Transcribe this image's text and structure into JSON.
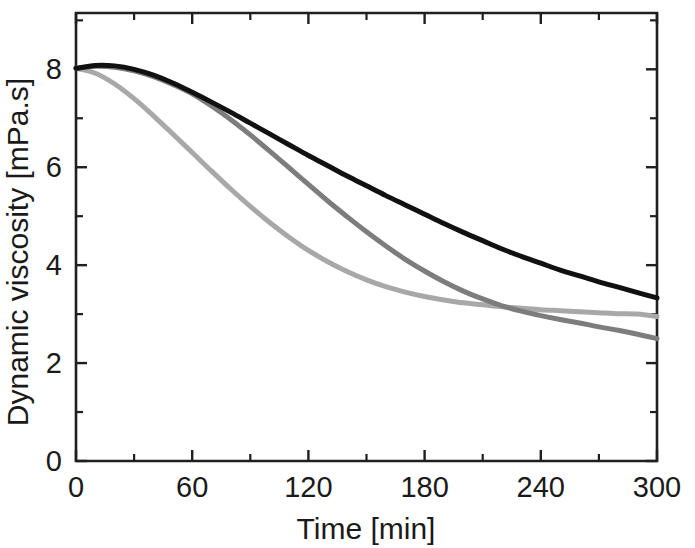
{
  "chart_data": {
    "type": "line",
    "title": "",
    "subtitle": "",
    "xlabel": "Time [min]",
    "ylabel": "Dynamic viscosity [mPa.s]",
    "xlim": [
      0,
      300
    ],
    "ylim": [
      0,
      9.15
    ],
    "xticks": [
      0,
      60,
      120,
      180,
      240,
      300
    ],
    "xtick_labels": [
      "0",
      "60",
      "120",
      "180",
      "240",
      "300"
    ],
    "yticks": [
      0,
      2,
      4,
      6,
      8
    ],
    "ytick_labels": [
      "0",
      "2",
      "4",
      "6",
      "8"
    ],
    "x_minor_tick_interval": 30,
    "y_minor_tick_interval": 1,
    "grid": false,
    "legend": false,
    "legend_position": "none",
    "annotations": [],
    "x": [
      0,
      10,
      20,
      30,
      40,
      50,
      60,
      70,
      80,
      90,
      100,
      110,
      120,
      130,
      140,
      150,
      160,
      170,
      180,
      190,
      200,
      210,
      220,
      230,
      240,
      250,
      260,
      270,
      280,
      290,
      300
    ],
    "series": [
      {
        "name": "black-curve",
        "color": "#111111",
        "stroke_width": 5.0,
        "values": [
          8.02,
          8.08,
          8.07,
          8.0,
          7.88,
          7.72,
          7.53,
          7.33,
          7.12,
          6.9,
          6.68,
          6.46,
          6.24,
          6.03,
          5.82,
          5.62,
          5.42,
          5.23,
          5.04,
          4.85,
          4.67,
          4.5,
          4.33,
          4.18,
          4.04,
          3.9,
          3.78,
          3.66,
          3.55,
          3.44,
          3.33
        ]
      },
      {
        "name": "medium-gray-curve",
        "color": "#7d7d7d",
        "stroke_width": 5.0,
        "values": [
          8.02,
          8.06,
          8.04,
          7.97,
          7.85,
          7.69,
          7.5,
          7.25,
          6.97,
          6.66,
          6.33,
          5.99,
          5.65,
          5.31,
          4.99,
          4.68,
          4.39,
          4.12,
          3.88,
          3.66,
          3.47,
          3.31,
          3.17,
          3.06,
          2.97,
          2.89,
          2.82,
          2.74,
          2.67,
          2.59,
          2.5
        ]
      },
      {
        "name": "light-gray-curve",
        "color": "#a8a8a8",
        "stroke_width": 5.0,
        "values": [
          8.02,
          7.92,
          7.7,
          7.4,
          7.05,
          6.68,
          6.3,
          5.92,
          5.55,
          5.2,
          4.87,
          4.57,
          4.3,
          4.07,
          3.87,
          3.7,
          3.56,
          3.45,
          3.36,
          3.29,
          3.23,
          3.19,
          3.15,
          3.12,
          3.09,
          3.07,
          3.05,
          3.03,
          3.01,
          3.0,
          2.95
        ]
      }
    ]
  }
}
